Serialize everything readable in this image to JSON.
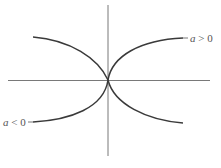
{
  "diagram": {
    "type": "curve-sketch",
    "labels": {
      "positive": {
        "var": "a",
        "rel": " > ",
        "val": "0"
      },
      "negative": {
        "var": "a",
        "rel": " < ",
        "val": "0"
      }
    },
    "colors": {
      "axis": "#6a6a6a",
      "curve": "#3a3a3a",
      "label": "#555555",
      "background": "#ffffff"
    }
  }
}
